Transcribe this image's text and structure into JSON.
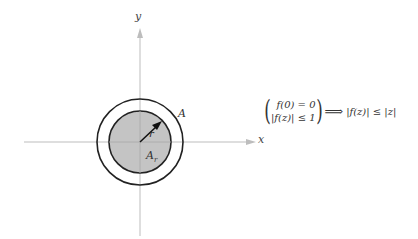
{
  "diagram": {
    "axes": {
      "x_label": "x",
      "y_label": "y",
      "axis_color": "#b8b8b8"
    },
    "circles": {
      "outer_label": "A",
      "inner_label_main": "A",
      "inner_label_sub": "r",
      "radius_label": "r",
      "inner_fill": "#c4c4c4",
      "stroke_color": "#222222"
    },
    "formula": {
      "line1": "f(0) = 0",
      "line2": "|f(z)| ≤ 1",
      "implies": "⟹",
      "result": "|f(z)| ≤ |z|"
    }
  }
}
